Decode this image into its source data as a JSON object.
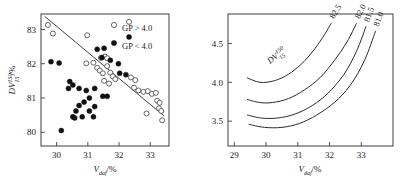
{
  "figure": {
    "panel_count": 2
  },
  "chart_data": [
    {
      "type": "scatter",
      "panel": "left",
      "title": "",
      "xlabel": "V_daf/%",
      "xlabel_parts": {
        "symbol": "V",
        "sub": "daf",
        "unit": "/%"
      },
      "ylabel": "DV_15^150/%",
      "ylabel_parts": {
        "symbol": "DV",
        "sub": "15",
        "sup": "150",
        "unit": "/%"
      },
      "xlim": [
        29.5,
        33.6
      ],
      "ylim": [
        79.6,
        83.45
      ],
      "xticks": [
        30,
        31,
        32,
        33
      ],
      "yticks": [
        80,
        81,
        82,
        83
      ],
      "grid": false,
      "legend_position": "top-right",
      "legend": [
        {
          "label": "GP > 4.0",
          "marker": "open-circle"
        },
        {
          "label": "GP < 4.0",
          "marker": "filled-circle"
        }
      ],
      "trend_line": {
        "x": [
          29.62,
          33.45
        ],
        "y": [
          83.38,
          80.47
        ]
      },
      "series": [
        {
          "name": "GP > 4.0",
          "marker": "open-circle",
          "points": [
            [
              29.72,
              83.13
            ],
            [
              29.88,
              82.88
            ],
            [
              30.98,
              82.83
            ],
            [
              32.32,
              83.22
            ],
            [
              30.95,
              82.01
            ],
            [
              31.18,
              82.03
            ],
            [
              31.42,
              82.17
            ],
            [
              31.55,
              82.21
            ],
            [
              31.62,
              82.16
            ],
            [
              31.3,
              81.88
            ],
            [
              31.38,
              81.8
            ],
            [
              31.48,
              81.72
            ],
            [
              31.62,
              81.93
            ],
            [
              31.72,
              81.74
            ],
            [
              31.8,
              81.63
            ],
            [
              31.88,
              81.55
            ],
            [
              31.52,
              81.5
            ],
            [
              31.68,
              81.42
            ],
            [
              32.38,
              81.6
            ],
            [
              32.52,
              81.52
            ],
            [
              32.48,
              81.3
            ],
            [
              32.62,
              81.22
            ],
            [
              32.78,
              81.18
            ],
            [
              32.92,
              81.2
            ],
            [
              33.05,
              81.12
            ],
            [
              33.18,
              81.15
            ],
            [
              33.22,
              80.92
            ],
            [
              33.3,
              80.86
            ],
            [
              33.28,
              80.7
            ],
            [
              33.35,
              80.62
            ],
            [
              32.88,
              80.55
            ],
            [
              33.38,
              80.35
            ]
          ]
        },
        {
          "name": "GP < 4.0",
          "marker": "filled-circle",
          "points": [
            [
              32.32,
              82.78
            ],
            [
              29.82,
              82.06
            ],
            [
              30.08,
              82.02
            ],
            [
              31.3,
              82.42
            ],
            [
              31.52,
              82.45
            ],
            [
              31.45,
              82.18
            ],
            [
              31.98,
              82.0
            ],
            [
              31.72,
              82.1
            ],
            [
              32.02,
              81.72
            ],
            [
              32.22,
              81.68
            ],
            [
              30.42,
              81.48
            ],
            [
              30.52,
              81.38
            ],
            [
              30.38,
              81.28
            ],
            [
              30.72,
              81.28
            ],
            [
              30.95,
              81.22
            ],
            [
              31.22,
              81.28
            ],
            [
              31.48,
              81.05
            ],
            [
              31.62,
              81.05
            ],
            [
              31.05,
              81.0
            ],
            [
              30.88,
              80.88
            ],
            [
              30.72,
              80.78
            ],
            [
              30.62,
              80.62
            ],
            [
              30.52,
              80.45
            ],
            [
              30.58,
              80.42
            ],
            [
              30.82,
              80.45
            ],
            [
              31.05,
              80.62
            ],
            [
              31.22,
              80.75
            ],
            [
              31.18,
              80.45
            ],
            [
              30.15,
              80.05
            ]
          ]
        }
      ]
    },
    {
      "type": "line",
      "panel": "right",
      "title": "",
      "xlabel": "V_daf/%",
      "xlabel_parts": {
        "symbol": "V",
        "sub": "daf",
        "unit": "/%"
      },
      "ylabel": "GP/(lgMF)",
      "xlim": [
        28.8,
        34.0
      ],
      "ylim": [
        3.18,
        4.88
      ],
      "xticks": [
        29,
        30,
        31,
        32,
        33
      ],
      "yticks": [
        3.5,
        4.0,
        4.5
      ],
      "ytick_labels": [
        "3.5",
        "4.0",
        "4.5"
      ],
      "grid": false,
      "annotation": {
        "text": "DV_15^150",
        "parts": {
          "symbol": "DV",
          "sub": "15",
          "sup": "150"
        }
      },
      "series": [
        {
          "name": "82.5",
          "label": "82.5",
          "x": [
            29.4,
            29.7,
            30.0,
            30.4,
            30.8,
            31.2,
            31.55,
            31.85,
            32.05
          ],
          "y": [
            4.06,
            4.01,
            4.0,
            4.04,
            4.13,
            4.27,
            4.44,
            4.62,
            4.76
          ]
        },
        {
          "name": "82.0",
          "label": "82.0",
          "x": [
            29.4,
            29.8,
            30.2,
            30.7,
            31.2,
            31.7,
            32.15,
            32.55,
            32.85
          ],
          "y": [
            3.78,
            3.74,
            3.74,
            3.79,
            3.9,
            4.06,
            4.28,
            4.52,
            4.76
          ]
        },
        {
          "name": "81.5",
          "label": "81.5",
          "x": [
            29.4,
            29.85,
            30.35,
            30.9,
            31.45,
            31.95,
            32.45,
            32.85,
            33.15
          ],
          "y": [
            3.58,
            3.54,
            3.54,
            3.59,
            3.7,
            3.86,
            4.1,
            4.4,
            4.72
          ]
        },
        {
          "name": "81.0",
          "label": "81.0",
          "x": [
            29.45,
            29.95,
            30.5,
            31.05,
            31.6,
            32.15,
            32.65,
            33.1,
            33.45
          ],
          "y": [
            3.46,
            3.42,
            3.42,
            3.47,
            3.58,
            3.74,
            3.96,
            4.28,
            4.66
          ]
        }
      ]
    }
  ]
}
